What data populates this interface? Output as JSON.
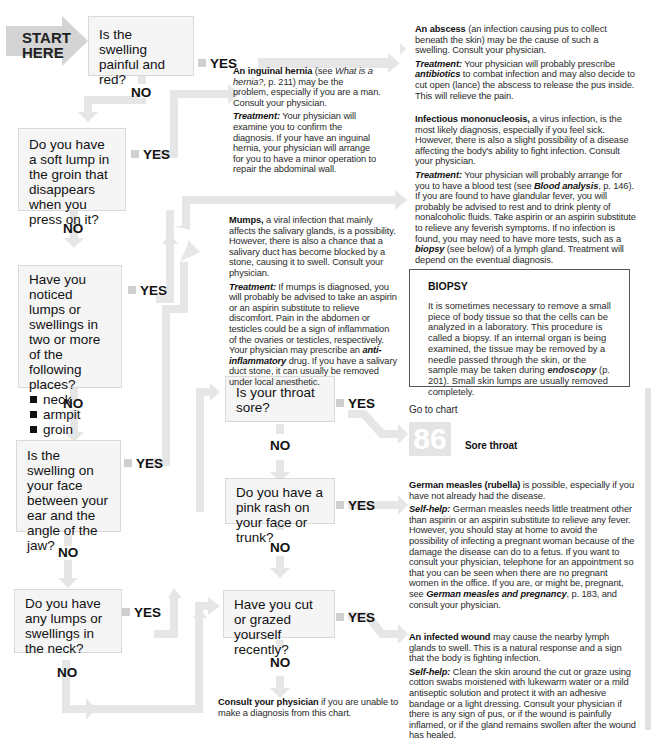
{
  "start": {
    "line1": "START",
    "line2": "HERE"
  },
  "questions": [
    {
      "id": "q1",
      "text": "Is the swelling painful and red?"
    },
    {
      "id": "q2",
      "text": "Do you have a soft lump in the groin that disappears when you press on it?"
    },
    {
      "id": "q3",
      "text": "Have you noticed lumps or swellings in two or more of the following places?",
      "bullets": [
        "neck",
        "armpit",
        "groin"
      ]
    },
    {
      "id": "q4",
      "text": "Is the swelling on your face between your ear and the angle of the jaw?"
    },
    {
      "id": "q5",
      "text": "Do you have any lumps or swellings in the neck?"
    },
    {
      "id": "q6",
      "text": "Is your throat sore?"
    },
    {
      "id": "q7",
      "text": "Do you have a pink rash on your face or trunk?"
    },
    {
      "id": "q8",
      "text": "Have you cut or grazed yourself recently?"
    }
  ],
  "labels": {
    "yes": "YES",
    "no": "NO"
  },
  "outcomes": {
    "abscess": {
      "title": "An abscess",
      "body": " (an infection causing pus to collect beneath the skin) may be the cause of such a swelling. Consult your physician.",
      "sub_label": "Treatment:",
      "sub_pre": " Your physician will probably prescribe ",
      "sub_link": "antibiotics",
      "sub_post": " to combat infection and may also decide to cut open (lance) the abscess to release the pus inside. This will relieve the pain."
    },
    "hernia": {
      "title": "An inguinal hernia",
      "body_pre": " (see ",
      "body_link": "What is a hernia?",
      "body_post": ", p. 211) may be the problem, especially if you are a man. Consult your physician.",
      "sub_label": "Treatment:",
      "sub_body": " Your physician will examine you to confirm the diagnosis. If your have an inguinal hernia, your physician will arrange for you to have a minor operation to repair the abdominal wall."
    },
    "mono": {
      "title": "Infectious mononucleosis,",
      "body": " a virus infection, is the most likely diagnosis, especially if you feel sick. However, there is also a slight possibility of a disease affecting the body's ability to fight infection. Consult your physician.",
      "sub_label": "Treatment:",
      "sub_pre": " Your physician will probably arrange for you to have a blood test (see ",
      "sub_link": "Blood analysis",
      "sub_mid": ", p. 146). If you are found to have glandular fever, you will probably be advised to rest and to drink plenty of nonalcoholic fluids. Take aspirin or an aspirin substitute to relieve any feverish symptoms. If no infection is found, you may need to have more tests, such as a ",
      "sub_link2": "biopsy",
      "sub_post": " (see below) of a lymph gland. Treatment will depend on the eventual diagnosis."
    },
    "mumps": {
      "title": "Mumps,",
      "body": " a viral infection that mainly affects the salivary glands, is a possibility. However, there is also a chance that a salivary duct has become blocked by a stone, causing it to swell. Consult your physician.",
      "sub_label": "Treatment:",
      "sub_pre": " If mumps is diagnosed, you will probably be advised to take an aspirin or an aspirin substitute to relieve discomfort. Pain in the abdomen or testicles could be a sign of inflammation of the ovaries or testicles, respectively. Your physician may prescribe an ",
      "sub_link": "anti-inflammatory",
      "sub_post": " drug. If you have a salivary duct stone, it can usually be removed under local anesthetic."
    },
    "goto": {
      "prefix": "Go to chart",
      "number": "86",
      "title": "Sore throat"
    },
    "measles": {
      "title": "German measles (rubella)",
      "body": " is possible, especially if you have not already had the disease.",
      "sub_label": "Self-help:",
      "sub_pre": " German measles needs little treatment other than aspirin or an aspirin substitute to relieve any fever. However, you should stay at home to avoid the possibility of infecting a pregnant woman because of the damage the disease can do to a fetus. If you want to consult your physician, telephone for an appointment so that you can be seen when there are no pregnant women in the office. If you are, or might be, pregnant, see ",
      "sub_link": "German measles and pregnancy",
      "sub_post": ", p. 183, and consult your physician."
    },
    "wound": {
      "title": "An infected wound",
      "body": " may cause the nearby lymph glands to swell. This is a natural response and a sign that the body is fighting infection.",
      "sub_label": "Self-help:",
      "sub_body": " Clean the skin around the cut or graze using cotton swabs moistened with lukewarm water or a mild antiseptic solution and protect it with an adhesive bandage or a light dressing. Consult your physician if there is any sign of pus, or if the wound is painfully inflamed, or if the gland remains swollen after the wound has healed."
    },
    "consult": {
      "title": "Consult your physician",
      "body": " if you are unable to make a diagnosis from this chart."
    }
  },
  "biopsy": {
    "heading": "BIOPSY",
    "pre": "It is sometimes necessary to remove a small piece of body tissue so that the cells can be analyzed in a laboratory. This procedure is called a biopsy. If an internal organ is being examined, the tissue may be removed by a needle passed through the skin, or the sample may be taken during ",
    "link": "endoscopy",
    "post": " (p. 201). Small skin lumps are usually removed completely."
  }
}
